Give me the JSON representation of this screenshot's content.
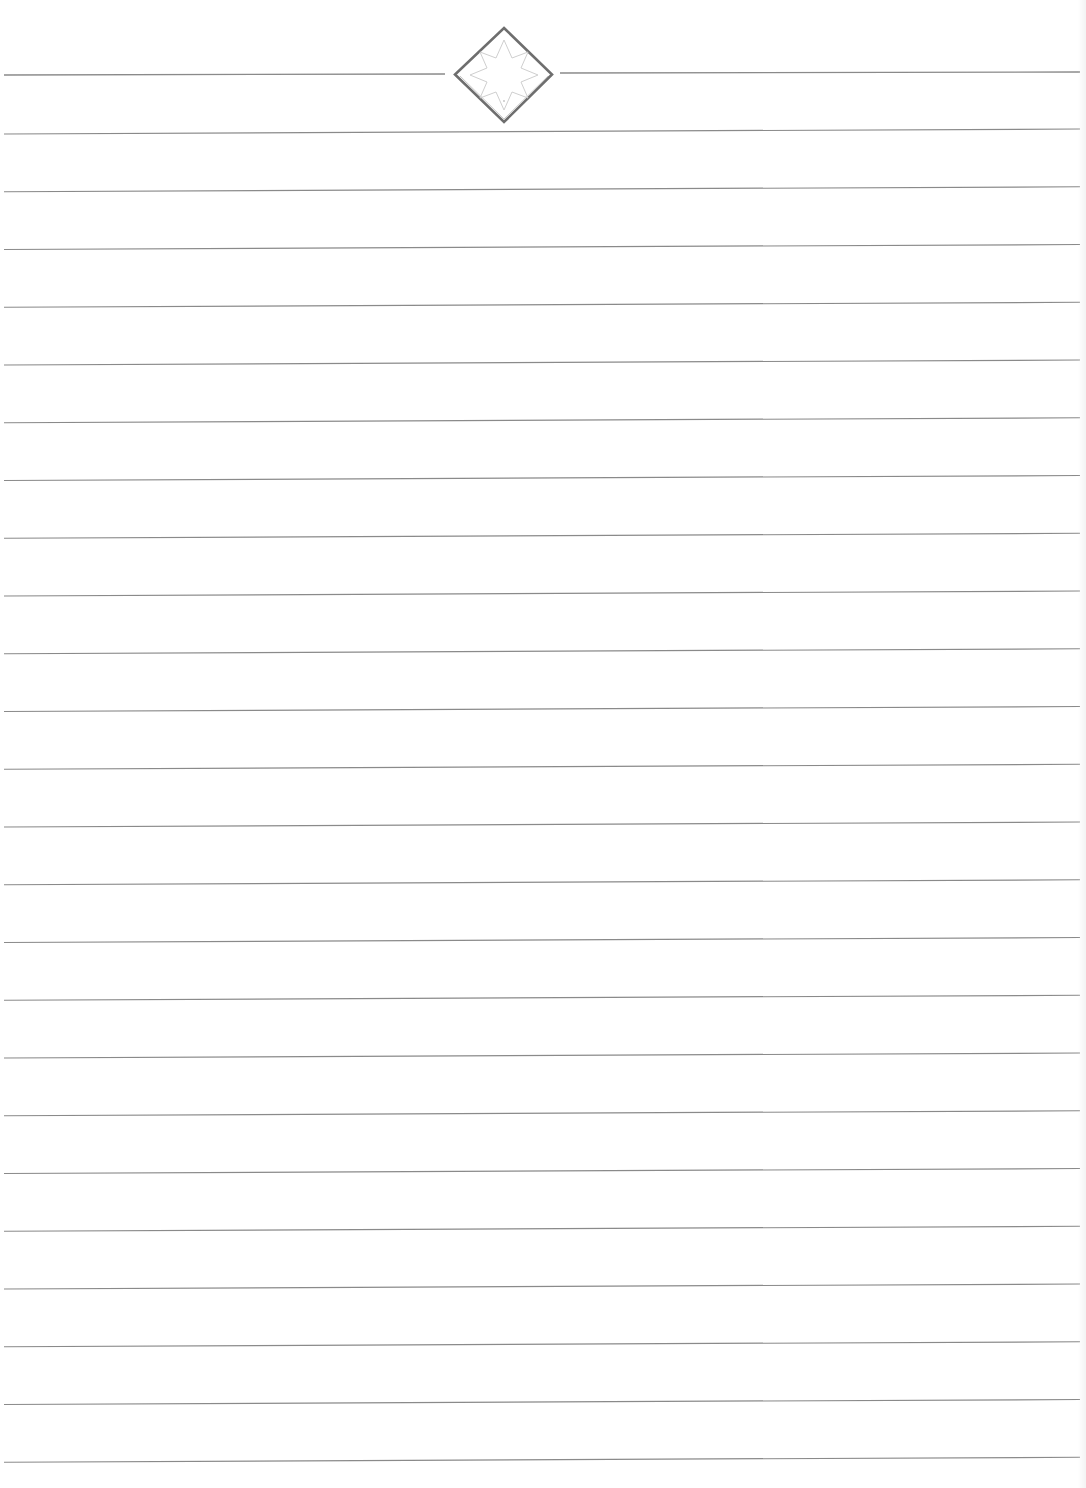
{
  "page": {
    "type": "ruled-notebook-page",
    "background": "#ffffff",
    "line_color": "#8a8a8a",
    "emblem_color": "#6e6e6e",
    "emblem_inner_color": "#c4c4c4"
  },
  "header": {
    "emblem": "diamond-star-emblem",
    "line_y_left": 75,
    "line_y_right": 72,
    "left_segment_end_x": 445,
    "right_segment_start_x": 560
  },
  "rules": {
    "count": 24,
    "first_y_left": 134,
    "first_y_right": 129,
    "spacing": 57.75,
    "x_start": 4,
    "x_end": 1080
  }
}
